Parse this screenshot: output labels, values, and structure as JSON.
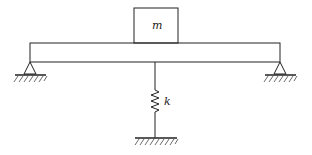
{
  "diagram": {
    "title": "",
    "labels": {
      "mass": "m",
      "spring": "k"
    },
    "components": [
      {
        "type": "mass-block",
        "label": "m",
        "position": "on top of beam, centered"
      },
      {
        "type": "beam",
        "support": "simply supported (pins at both ends)"
      },
      {
        "type": "pin-support",
        "position": "left end"
      },
      {
        "type": "pin-support",
        "position": "right end"
      },
      {
        "type": "spring",
        "label": "k",
        "position": "beneath beam midspan, to ground"
      },
      {
        "type": "ground",
        "position": "below spring"
      }
    ],
    "colors": {
      "stroke": "#222222",
      "background": "#ffffff"
    }
  }
}
